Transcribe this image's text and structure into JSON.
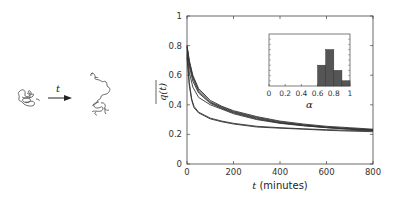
{
  "schematic": {
    "arrow_label": "t",
    "left_icon": "compact-polymer-icon",
    "right_icon": "extended-polymer-icon",
    "arrow_icon": "right-arrow-icon"
  },
  "chart_data": [
    {
      "type": "line",
      "title": "",
      "xlabel_italic": "t",
      "xlabel": " (minutes)",
      "ylabel": "q(t)",
      "xlim": [
        0,
        800
      ],
      "ylim": [
        0,
        1
      ],
      "xticks": [
        0,
        200,
        400,
        600,
        800
      ],
      "xtick_labels": [
        "0",
        "200",
        "400",
        "600",
        "800"
      ],
      "yticks": [
        0,
        0.2,
        0.4,
        0.6,
        0.8,
        1
      ],
      "ytick_labels": [
        "0",
        "0.2",
        "0.4",
        "0.6",
        "0.8",
        "1"
      ],
      "grid": false,
      "series": [
        {
          "name": "trajectory-1",
          "x": [
            0,
            10,
            25,
            50,
            100,
            150,
            200,
            300,
            400,
            500,
            600,
            700,
            800
          ],
          "y": [
            0.8,
            0.7,
            0.6,
            0.51,
            0.43,
            0.39,
            0.36,
            0.32,
            0.29,
            0.27,
            0.255,
            0.245,
            0.235
          ]
        },
        {
          "name": "trajectory-2",
          "x": [
            0,
            10,
            25,
            50,
            100,
            150,
            200,
            300,
            400,
            500,
            600,
            700,
            800
          ],
          "y": [
            0.8,
            0.69,
            0.59,
            0.5,
            0.42,
            0.385,
            0.355,
            0.315,
            0.285,
            0.265,
            0.25,
            0.24,
            0.232
          ]
        },
        {
          "name": "trajectory-3",
          "x": [
            0,
            10,
            25,
            50,
            100,
            150,
            200,
            300,
            400,
            500,
            600,
            700,
            800
          ],
          "y": [
            0.79,
            0.68,
            0.58,
            0.49,
            0.415,
            0.38,
            0.35,
            0.31,
            0.28,
            0.262,
            0.248,
            0.238,
            0.23
          ]
        },
        {
          "name": "trajectory-4",
          "x": [
            0,
            10,
            25,
            50,
            100,
            150,
            200,
            300,
            400,
            500,
            600,
            700,
            800
          ],
          "y": [
            0.78,
            0.66,
            0.56,
            0.48,
            0.41,
            0.375,
            0.345,
            0.305,
            0.278,
            0.26,
            0.246,
            0.236,
            0.228
          ]
        },
        {
          "name": "trajectory-5",
          "x": [
            0,
            10,
            25,
            50,
            100,
            150,
            200,
            300,
            400,
            500,
            600,
            700,
            800
          ],
          "y": [
            0.76,
            0.62,
            0.52,
            0.45,
            0.4,
            0.37,
            0.34,
            0.3,
            0.275,
            0.258,
            0.245,
            0.235,
            0.227
          ]
        },
        {
          "name": "trajectory-low-1",
          "x": [
            0,
            10,
            20,
            30,
            50,
            100,
            150,
            200,
            300,
            400,
            500,
            600,
            700,
            800
          ],
          "y": [
            0.74,
            0.55,
            0.44,
            0.39,
            0.35,
            0.31,
            0.29,
            0.275,
            0.255,
            0.245,
            0.238,
            0.232,
            0.228,
            0.224
          ]
        },
        {
          "name": "trajectory-low-2",
          "x": [
            0,
            10,
            20,
            30,
            50,
            100,
            150,
            200,
            300,
            400,
            500,
            600,
            700,
            800
          ],
          "y": [
            0.72,
            0.53,
            0.43,
            0.38,
            0.345,
            0.305,
            0.285,
            0.27,
            0.25,
            0.242,
            0.235,
            0.228,
            0.222,
            0.218
          ]
        }
      ]
    },
    {
      "type": "bar",
      "title": "",
      "xlabel": "α",
      "ylabel": "",
      "xlim": [
        0,
        1
      ],
      "ylim": [
        0,
        10
      ],
      "xticks": [
        0,
        0.2,
        0.4,
        0.6,
        0.8,
        1
      ],
      "xtick_labels": [
        "0",
        "0.2",
        "0.4",
        "0.6",
        "0.8",
        "1"
      ],
      "bins": [
        [
          0.6,
          0.7
        ],
        [
          0.7,
          0.8
        ],
        [
          0.8,
          0.9
        ],
        [
          0.9,
          1.0
        ]
      ],
      "values": [
        4,
        7,
        3,
        1
      ],
      "bar_color": "#555555",
      "legend": "inset top-right"
    }
  ]
}
